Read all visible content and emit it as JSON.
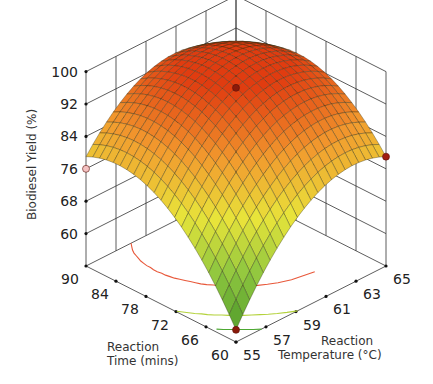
{
  "chart_data": {
    "type": "surface3d",
    "title": "",
    "zlabel": "Biodiesel Yield (%)",
    "xlabel": "Reaction Time (mins)",
    "ylabel": "Reaction Temperature (°C)",
    "z_ticks": [
      "60",
      "68",
      "76",
      "84",
      "92",
      "100"
    ],
    "time_ticks": [
      "60",
      "66",
      "72",
      "78",
      "84",
      "90"
    ],
    "temperature_ticks": [
      "55",
      "57",
      "59",
      "61",
      "63",
      "65"
    ],
    "zlim": [
      52,
      100
    ],
    "time_range": [
      60,
      90
    ],
    "temperature_range": [
      55,
      65
    ],
    "surface": {
      "model": "quadratic",
      "center_time": 75,
      "center_temperature": 60,
      "peak_yield": 96,
      "corner_yields": {
        "t60_T55": 55,
        "t90_T55": 79,
        "t60_T65": 79,
        "t90_T65": 86
      }
    },
    "design_points": [
      {
        "time": 75,
        "temperature": 60,
        "yield": 96,
        "color": "#8b1a0a"
      },
      {
        "time": 60,
        "temperature": 55,
        "yield": 55,
        "color": "#8b1a0a"
      },
      {
        "time": 90,
        "temperature": 55,
        "yield": 76,
        "color": "#f4c2c2"
      },
      {
        "time": 60,
        "temperature": 65,
        "yield": 79,
        "color": "#a01e10"
      }
    ],
    "contours": [
      {
        "level": 90,
        "color": "#e8583a"
      },
      {
        "level": 75,
        "color": "#b4d23c"
      },
      {
        "level": 65,
        "color": "#4ca832"
      }
    ],
    "colormap": [
      "#4f9a2a",
      "#8dc63f",
      "#e8e43a",
      "#f29a2e",
      "#e03c10"
    ],
    "grid": true,
    "legend": null
  }
}
